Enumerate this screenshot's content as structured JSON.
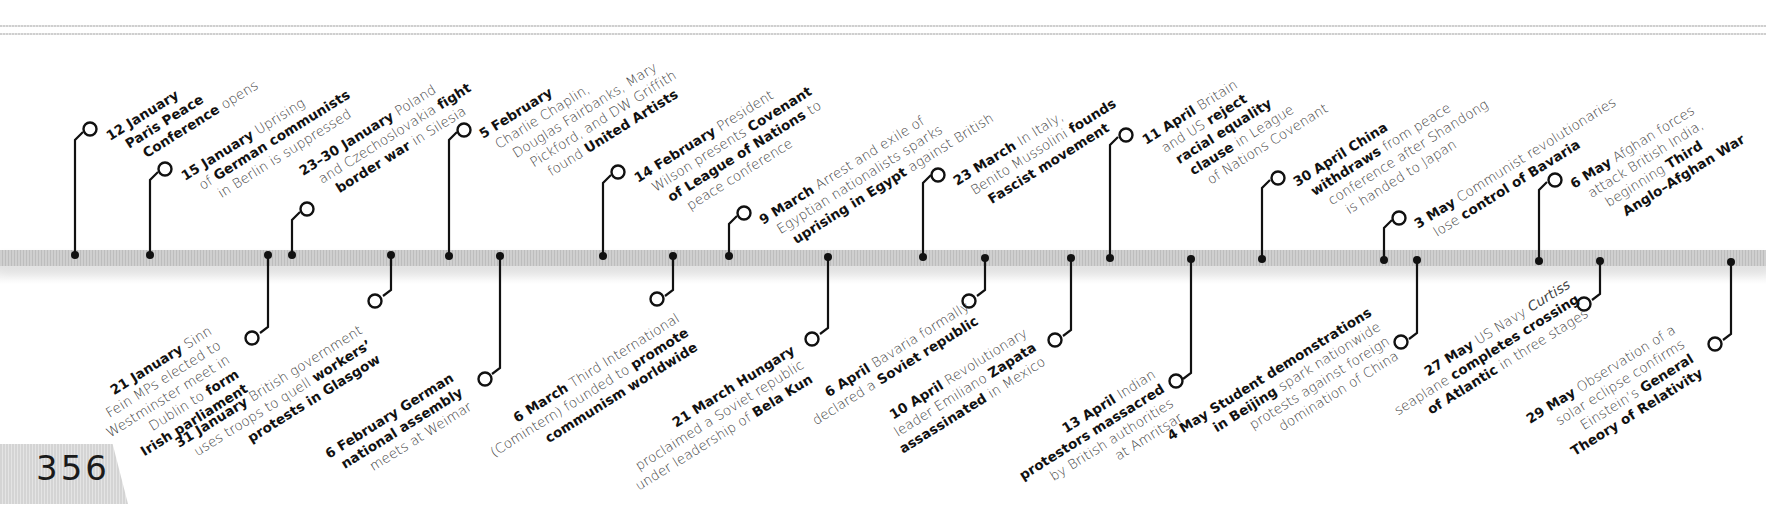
{
  "page": {
    "number": "356"
  },
  "timeline": {
    "year_context": "1919",
    "events_above": [
      {
        "id": "e12jan",
        "date": "12 January",
        "lines": [
          [
            "12 January",
            ""
          ],
          [
            "Paris Peace",
            ""
          ],
          [
            "Conference",
            " opens"
          ]
        ],
        "axis_x": 75
      },
      {
        "id": "e15jan",
        "date": "15 January",
        "lines": [
          [
            "15 January",
            " Uprising"
          ],
          [
            "",
            "of "
          ],
          [
            "German communists",
            ""
          ],
          [
            "",
            "in Berlin is suppressed"
          ]
        ],
        "axis_x": 150
      },
      {
        "id": "e23jan",
        "date": "23–30 January",
        "lines": [
          [
            "23–30 January",
            " Poland"
          ],
          [
            "",
            "and Czechoslovakia "
          ],
          [
            "fight",
            ""
          ],
          [
            "border war",
            " in Silesia"
          ]
        ],
        "axis_x": 292
      },
      {
        "id": "e5feb",
        "date": "5 February",
        "lines": [
          [
            "5 February",
            ""
          ],
          [
            "",
            "Charlie Chaplin,"
          ],
          [
            "",
            "Douglas Fairbanks, Mary"
          ],
          [
            "",
            "Pickford, and DW Griffith"
          ],
          [
            "",
            "found "
          ],
          [
            "United Artists",
            ""
          ]
        ],
        "axis_x": 449
      },
      {
        "id": "e14feb",
        "date": "14 February",
        "lines": [
          [
            "14 February",
            " President"
          ],
          [
            "",
            "Wilson presents "
          ],
          [
            "Covenant",
            ""
          ],
          [
            "of League of Nations",
            " to"
          ],
          [
            "",
            "peace conference"
          ]
        ],
        "axis_x": 603
      },
      {
        "id": "e9mar",
        "date": "9 March",
        "lines": [
          [
            "9 March",
            " Arrest and exile of"
          ],
          [
            "",
            "Egyptian nationalists sparks"
          ],
          [
            "uprising in Egypt",
            " against British"
          ]
        ],
        "axis_x": 729
      },
      {
        "id": "e23mar",
        "date": "23 March",
        "lines": [
          [
            "23 March",
            " In Italy,"
          ],
          [
            "",
            "Benito Mussolini "
          ],
          [
            "founds",
            ""
          ],
          [
            "Fascist movement",
            ""
          ]
        ],
        "axis_x": 923
      },
      {
        "id": "e11apr",
        "date": "11 April",
        "lines": [
          [
            "11 April",
            " Britain"
          ],
          [
            "",
            "and US "
          ],
          [
            "reject",
            ""
          ],
          [
            "racial equality",
            ""
          ],
          [
            "clause",
            " in League"
          ],
          [
            "",
            "of Nations Covenant"
          ]
        ],
        "axis_x": 1110
      },
      {
        "id": "e30apr",
        "date": "30 April",
        "lines": [
          [
            "30 April China",
            ""
          ],
          [
            "withdraws",
            " from peace"
          ],
          [
            "",
            "conference after Shandong"
          ],
          [
            "",
            "is handed to Japan"
          ]
        ],
        "axis_x": 1262
      },
      {
        "id": "e3may",
        "date": "3 May",
        "lines": [
          [
            "3 May",
            " Communist revolutionaries"
          ],
          [
            "",
            "lose "
          ],
          [
            "control of Bavaria",
            ""
          ]
        ],
        "axis_x": 1384
      },
      {
        "id": "e6may",
        "date": "6 May",
        "lines": [
          [
            "6 May",
            " Afghan forces"
          ],
          [
            "",
            "attack British India,"
          ],
          [
            "",
            "beginning "
          ],
          [
            "Third",
            ""
          ],
          [
            "Anglo–Afghan War",
            ""
          ]
        ],
        "axis_x": 1539
      }
    ],
    "events_below": [
      {
        "id": "e21jan",
        "date": "21 January",
        "lines": [
          [
            "21 January",
            " Sinn"
          ],
          [
            "",
            "Fein MPs elected to"
          ],
          [
            "",
            "Westminster meet in"
          ],
          [
            "",
            "Dublin to "
          ],
          [
            "form",
            ""
          ],
          [
            "Irish parliament",
            ""
          ]
        ],
        "axis_x": 268
      },
      {
        "id": "e31jan",
        "date": "31 January",
        "lines": [
          [
            "31 January",
            " British government"
          ],
          [
            "",
            "uses troops to quell "
          ],
          [
            "workers’",
            ""
          ],
          [
            "protests in Glasgow",
            ""
          ]
        ],
        "axis_x": 391
      },
      {
        "id": "e6feb",
        "date": "6 February",
        "lines": [
          [
            "6 February German",
            ""
          ],
          [
            "national assembly",
            ""
          ],
          [
            "",
            "meets at Weimar"
          ]
        ],
        "axis_x": 500
      },
      {
        "id": "e6mar",
        "date": "6 March",
        "lines": [
          [
            "6 March",
            " Third International"
          ],
          [
            "",
            "(Comintern) founded to "
          ],
          [
            "promote",
            ""
          ],
          [
            "communism worldwide",
            ""
          ]
        ],
        "axis_x": 673
      },
      {
        "id": "e21mar",
        "date": "21 March",
        "lines": [
          [
            "21 March Hungary",
            ""
          ],
          [
            "",
            "proclaimed a Soviet republic"
          ],
          [
            "",
            "under leadership of "
          ],
          [
            "Bela Kun",
            ""
          ]
        ],
        "axis_x": 828
      },
      {
        "id": "e6apr",
        "date": "6 April",
        "lines": [
          [
            "6 April",
            " Bavaria formally"
          ],
          [
            "",
            "declared a "
          ],
          [
            "Soviet republic",
            ""
          ]
        ],
        "axis_x": 985
      },
      {
        "id": "e10apr",
        "date": "10 April",
        "lines": [
          [
            "10 April",
            " Revolutionary"
          ],
          [
            "",
            "leader Emiliano "
          ],
          [
            "Zapata",
            ""
          ],
          [
            "assassinated",
            " in Mexico"
          ]
        ],
        "axis_x": 1071
      },
      {
        "id": "e13apr",
        "date": "13 April",
        "lines": [
          [
            "13 April",
            " Indian"
          ],
          [
            "protestors massacred",
            ""
          ],
          [
            "",
            "by British authorities"
          ],
          [
            "",
            "at Amritsar"
          ]
        ],
        "axis_x": 1191
      },
      {
        "id": "e4may",
        "date": "4 May",
        "lines": [
          [
            "4 May Student demonstrations",
            ""
          ],
          [
            "in Beijing",
            " spark nationwide"
          ],
          [
            "",
            "protests against foreign"
          ],
          [
            "",
            "domination of China"
          ]
        ],
        "axis_x": 1417
      },
      {
        "id": "e27may",
        "date": "27 May",
        "lines": [
          [
            "27 May",
            " US Navy "
          ],
          [
            "",
            "Curtiss"
          ],
          [
            "",
            "seaplane "
          ],
          [
            "completes crossing",
            ""
          ],
          [
            "of Atlantic",
            " in three stages"
          ]
        ],
        "axis_x": 1600
      },
      {
        "id": "e29may",
        "date": "29 May",
        "lines": [
          [
            "29 May",
            " Observation of a"
          ],
          [
            "",
            "solar eclipse confirms"
          ],
          [
            "",
            "Einstein’s "
          ],
          [
            "General",
            ""
          ],
          [
            "Theory of Relativity",
            ""
          ]
        ],
        "axis_x": 1731
      }
    ]
  },
  "colors": {
    "ink": "#111111",
    "body_text": "#444444",
    "bar": "#c8c8c8",
    "tab": "#dcdcdc"
  }
}
